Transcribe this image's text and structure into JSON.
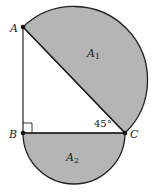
{
  "figure": {
    "colors": {
      "fill": "#b5b5b5",
      "stroke": "#222222",
      "background": "#ffffff"
    },
    "points": {
      "A": {
        "label": "A",
        "x": 23,
        "y": 27
      },
      "B": {
        "label": "B",
        "x": 23,
        "y": 133
      },
      "C": {
        "label": "C",
        "x": 125,
        "y": 133
      }
    },
    "regions": {
      "A1": {
        "label": "A",
        "subscript": "1"
      },
      "A2": {
        "label": "A",
        "subscript": "2"
      }
    },
    "angle_C": {
      "label": "45°"
    },
    "right_angle_marker": "B"
  }
}
